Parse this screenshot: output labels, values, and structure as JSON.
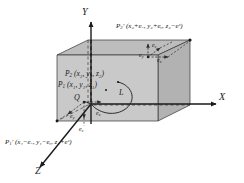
{
  "figure": {
    "background_color": "#ffffff",
    "box_fill_front": "#c8c8c8",
    "box_fill_top": "#bdbdbd",
    "box_fill_side": "#b0b0b0",
    "line_color": "#1a1a1a"
  },
  "axes": {
    "y_label": "Y",
    "x_label": "X",
    "z_label": "Z"
  },
  "points": {
    "p2_label": "P",
    "p2_sub": "2",
    "p2_coords": "(x₂, y₂, z₂)",
    "p1_label": "P",
    "p1_sub": "1",
    "p1_coords": "(x₁, y₁, z₁)",
    "q_label": "Q",
    "curve_label": "L"
  },
  "corner_labels": {
    "top_right": {
      "name": "P",
      "sub": "2",
      "prime": "′",
      "coords": "(x₂+eₓ,  y₂+eᵧ,  z₂−eᶻ)"
    },
    "bottom_left": {
      "name": "P",
      "sub": "1",
      "prime": "′",
      "coords": "(x₁−eₓ,  y₁−eᵧ,  z₁+eᶻ)"
    }
  },
  "epsilons": {
    "top_ez": "e",
    "top_ez_sub": "z",
    "top_ey": "e",
    "top_ey_sub": "y",
    "top_ex": "e",
    "top_ex_sub": "x",
    "q_ey": "e",
    "q_ey_sub": "y",
    "q_ex": "e",
    "q_ex_sub": "x",
    "q_ez": "e",
    "q_ez_sub": "z"
  }
}
